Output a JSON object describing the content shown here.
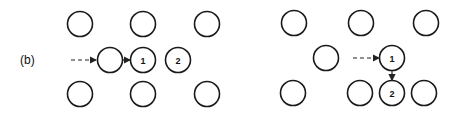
{
  "figure": {
    "panel_label": "(b)",
    "left_panel": {
      "circles": [
        {
          "cx": 80,
          "cy": 24,
          "label": ""
        },
        {
          "cx": 143,
          "cy": 24,
          "label": ""
        },
        {
          "cx": 207,
          "cy": 24,
          "label": ""
        },
        {
          "cx": 110,
          "cy": 60,
          "label": ""
        },
        {
          "cx": 143,
          "cy": 60,
          "label": "1"
        },
        {
          "cx": 178,
          "cy": 60,
          "label": "2"
        },
        {
          "cx": 80,
          "cy": 94,
          "label": ""
        },
        {
          "cx": 143,
          "cy": 94,
          "label": ""
        },
        {
          "cx": 207,
          "cy": 94,
          "label": ""
        }
      ]
    },
    "right_panel": {
      "circles": [
        {
          "cx": 294,
          "cy": 23,
          "label": ""
        },
        {
          "cx": 361,
          "cy": 23,
          "label": ""
        },
        {
          "cx": 426,
          "cy": 23,
          "label": ""
        },
        {
          "cx": 326,
          "cy": 58,
          "label": ""
        },
        {
          "cx": 392,
          "cy": 58,
          "label": "1"
        },
        {
          "cx": 293,
          "cy": 93,
          "label": ""
        },
        {
          "cx": 360,
          "cy": 93,
          "label": ""
        },
        {
          "cx": 392,
          "cy": 93,
          "label": "2"
        },
        {
          "cx": 424,
          "cy": 93,
          "label": ""
        }
      ]
    }
  }
}
